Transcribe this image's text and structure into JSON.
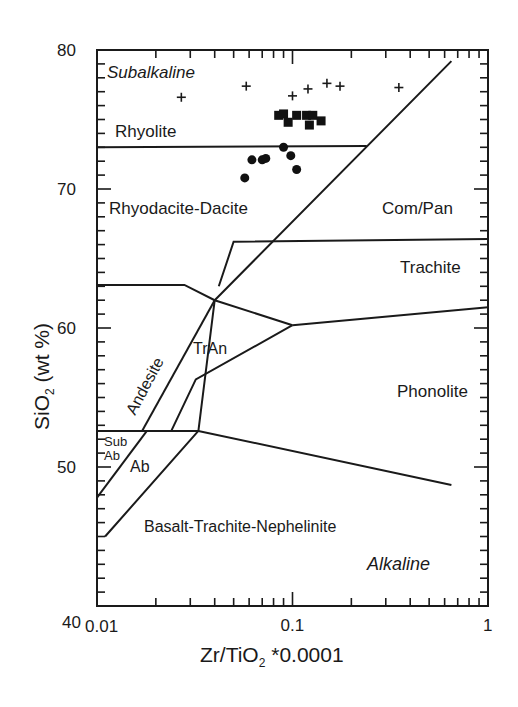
{
  "chart_data": {
    "type": "scatter",
    "title": "",
    "xlabel": "Zr/TiO2 *0.0001",
    "xlabel_main": "Zr/TiO",
    "xlabel_sub": "2",
    "xlabel_rest": " *0.0001",
    "ylabel": "SiO2 (wt %)",
    "ylabel_main": "SiO",
    "ylabel_sub": "2",
    "ylabel_rest": " (wt %)",
    "xscale": "log",
    "xlim": [
      0.01,
      1
    ],
    "ylim": [
      40,
      80
    ],
    "x_tick_labels": [
      "0.01",
      "0.1",
      "1"
    ],
    "y_tick_labels": [
      "40",
      "50",
      "60",
      "70",
      "80"
    ],
    "grid": false,
    "legend": null,
    "annotations": {
      "subalkaline": "Subalkaline",
      "alkaline": "Alkaline"
    },
    "fields": [
      {
        "label": "Rhyolite"
      },
      {
        "label": "Rhyodacite-Dacite"
      },
      {
        "label": "Com/Pan"
      },
      {
        "label": "Trachite"
      },
      {
        "label": "Andesite"
      },
      {
        "label": "TrAn"
      },
      {
        "label": "Phonolite"
      },
      {
        "label": "Sub"
      },
      {
        "label": "Ab"
      },
      {
        "label": "Ab"
      },
      {
        "label": "Basalt-Trachite-Nephelinite"
      }
    ],
    "boundaries": [
      {
        "name": "rhyolite-dacite",
        "points": [
          [
            0.01,
            73.0
          ],
          [
            0.24,
            73.1
          ]
        ]
      },
      {
        "name": "subalkaline-alkaline-main",
        "points": [
          [
            0.011,
            45.0
          ],
          [
            0.033,
            52.6
          ],
          [
            0.04,
            62.0
          ],
          [
            0.65,
            79.2
          ]
        ]
      },
      {
        "name": "compan-trachite",
        "points": [
          [
            0.042,
            63.0
          ],
          [
            0.05,
            66.2
          ],
          [
            1.0,
            66.4
          ]
        ]
      },
      {
        "name": "andesite-top",
        "points": [
          [
            0.01,
            63.1
          ],
          [
            0.028,
            63.1
          ],
          [
            0.04,
            62.0
          ],
          [
            0.1,
            60.2
          ]
        ]
      },
      {
        "name": "trachite-phonolite",
        "points": [
          [
            0.1,
            60.2
          ],
          [
            1.0,
            61.5
          ]
        ]
      },
      {
        "name": "tran-lower",
        "points": [
          [
            0.024,
            52.6
          ],
          [
            0.032,
            56.3
          ],
          [
            0.1,
            60.2
          ]
        ]
      },
      {
        "name": "andesite-left",
        "points": [
          [
            0.017,
            52.6
          ],
          [
            0.04,
            62.0
          ]
        ]
      },
      {
        "name": "basalt-top",
        "points": [
          [
            0.01,
            52.6
          ],
          [
            0.033,
            52.6
          ],
          [
            0.65,
            48.7
          ]
        ]
      },
      {
        "name": "subab-line",
        "points": [
          [
            0.01,
            47.8
          ],
          [
            0.018,
            52.6
          ]
        ]
      }
    ],
    "series": [
      {
        "name": "crosses",
        "marker": "+",
        "points": [
          [
            0.027,
            76.6
          ],
          [
            0.058,
            77.4
          ],
          [
            0.1,
            76.7
          ],
          [
            0.12,
            77.2
          ],
          [
            0.15,
            77.6
          ],
          [
            0.175,
            77.4
          ],
          [
            0.35,
            77.3
          ]
        ]
      },
      {
        "name": "squares",
        "marker": "square",
        "points": [
          [
            0.085,
            75.3
          ],
          [
            0.09,
            75.4
          ],
          [
            0.095,
            74.8
          ],
          [
            0.105,
            75.3
          ],
          [
            0.118,
            75.3
          ],
          [
            0.122,
            74.6
          ],
          [
            0.127,
            75.3
          ],
          [
            0.14,
            74.9
          ]
        ]
      },
      {
        "name": "circles",
        "marker": "circle",
        "points": [
          [
            0.057,
            70.8
          ],
          [
            0.062,
            72.1
          ],
          [
            0.07,
            72.1
          ],
          [
            0.073,
            72.2
          ],
          [
            0.09,
            73.0
          ],
          [
            0.098,
            72.4
          ],
          [
            0.105,
            71.4
          ]
        ]
      }
    ]
  }
}
